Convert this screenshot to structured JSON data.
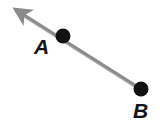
{
  "figure": {
    "kind": "geometry-ray-diagram",
    "width": 163,
    "height": 127,
    "background_color": "#ffffff"
  },
  "colors": {
    "ray": "#8c8c8c",
    "ray_shadow": "#b9b9b9",
    "arrowhead": "#8a8a8a",
    "point_fill": "#121212",
    "label_text": "#141414"
  },
  "ray": {
    "name": "ray-BA",
    "stroke_width": 3,
    "tail": {
      "x": 141,
      "y": 89
    },
    "tip": {
      "x": 10,
      "y": 6
    },
    "arrow_end": "tip",
    "arrowhead_length": 20,
    "arrowhead_width": 13
  },
  "points": [
    {
      "id": "A",
      "label": "A",
      "cx": 63,
      "cy": 36,
      "r": 7.5,
      "label_x": 34,
      "label_y": 36
    },
    {
      "id": "B",
      "label": "B",
      "cx": 141,
      "cy": 89,
      "r": 7.5,
      "label_x": 133,
      "label_y": 100
    }
  ]
}
